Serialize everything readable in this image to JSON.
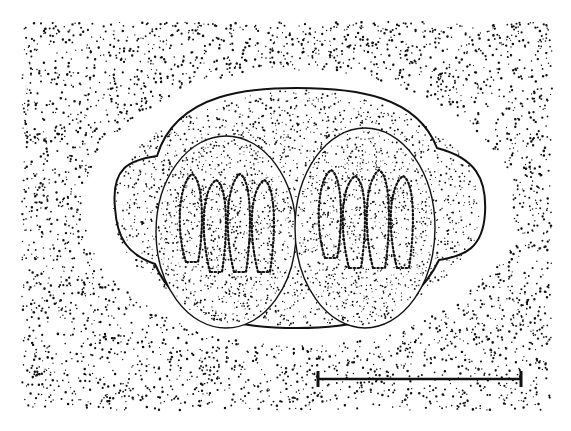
{
  "figure": {
    "type": "stippled scientific illustration",
    "background_color": "#ffffff",
    "ink_color": "#111111",
    "stipple_field": {
      "x0": 22,
      "y0": 22,
      "x1": 552,
      "y1": 410
    },
    "halo": {
      "cx": 298,
      "cy": 208,
      "rx": 215,
      "ry": 138
    },
    "oocyst": {
      "cx": 297,
      "cy": 208,
      "rx": 188,
      "ry": 120
    },
    "sporocysts": [
      {
        "name": "left",
        "cx": 226,
        "cy": 232,
        "rx": 70,
        "ry": 96,
        "sporozoites": 4
      },
      {
        "name": "right",
        "cx": 365,
        "cy": 228,
        "rx": 70,
        "ry": 100,
        "sporozoites": 4
      }
    ],
    "debris_circles": [
      {
        "cx": 413,
        "cy": 54,
        "r": 8
      },
      {
        "cx": 446,
        "cy": 82,
        "r": 9
      },
      {
        "cx": 210,
        "cy": 366,
        "r": 9
      },
      {
        "cx": 517,
        "cy": 320,
        "r": 6
      },
      {
        "cx": 60,
        "cy": 130,
        "r": 5
      }
    ],
    "scale_bar": {
      "x1": 318,
      "x2": 521,
      "y": 379,
      "label": ""
    }
  }
}
